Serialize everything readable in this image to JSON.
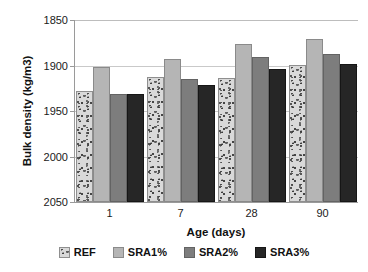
{
  "chart_data": {
    "type": "bar",
    "title": "",
    "xlabel": "Age (days)",
    "ylabel": "Bulk density (kg/m3)",
    "categories": [
      "1",
      "7",
      "28",
      "90"
    ],
    "ylim": [
      1850,
      2050
    ],
    "yticks": [
      1850,
      1900,
      1950,
      2000,
      2050
    ],
    "grid": true,
    "legend_position": "bottom",
    "series": [
      {
        "name": "REF",
        "color": "#d9d9d9",
        "values": [
          1970,
          1985,
          1984,
          1998
        ]
      },
      {
        "name": "SRA1%",
        "color": "#b5b5b5",
        "values": [
          1996,
          2005,
          2021,
          2027
        ]
      },
      {
        "name": "SRA2%",
        "color": "#7d7d7d",
        "values": [
          1967,
          1983,
          2007,
          2010
        ]
      },
      {
        "name": "SRA3%",
        "color": "#262626",
        "values": [
          1967,
          1976,
          1994,
          2000
        ]
      }
    ]
  },
  "axis": {
    "y_tick_labels": [
      "2050",
      "2000",
      "1950",
      "1900",
      "1850"
    ],
    "x_tick_labels": [
      "1",
      "7",
      "28",
      "90"
    ],
    "y_title": "Bulk density (kg/m3)",
    "x_title": "Age (days)"
  },
  "legend": {
    "items": [
      {
        "label": "REF"
      },
      {
        "label": "SRA1%"
      },
      {
        "label": "SRA2%"
      },
      {
        "label": "SRA3%"
      }
    ]
  }
}
